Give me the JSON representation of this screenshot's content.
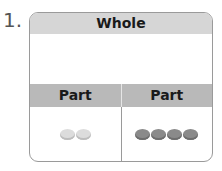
{
  "problem_number": "1.",
  "diagram": {
    "whole_label": "Whole",
    "parts": [
      {
        "label": "Part",
        "counters": 2,
        "shade": "light",
        "color": "#dcdcdc"
      },
      {
        "label": "Part",
        "counters": 4,
        "shade": "dark",
        "color": "#8a8a8a"
      }
    ]
  }
}
